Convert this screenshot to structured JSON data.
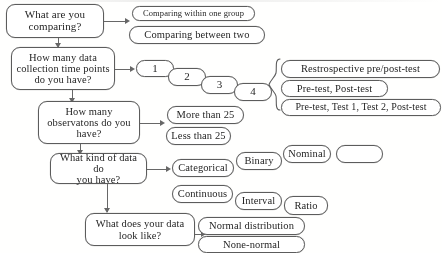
{
  "diagram": {
    "type": "flowchart",
    "ink_color": "#5d5d5d",
    "background_color": "#fdfdfc"
  },
  "questions": [
    {
      "id": "q1",
      "line1": "What are you",
      "line2": "comparing?"
    },
    {
      "id": "q2",
      "line1": "How many data",
      "line2": "collection time points",
      "line3": "do you have?"
    },
    {
      "id": "q3",
      "line1": "How many",
      "line2": "observatons do you",
      "line3": "have?"
    },
    {
      "id": "q4",
      "line1": "What kind of data do",
      "line2": "you have?"
    },
    {
      "id": "q5",
      "line1": "What does your data",
      "line2": "look like?"
    }
  ],
  "comparing_options": [
    {
      "label": "Comparing within one group"
    },
    {
      "label": "Comparing between two"
    }
  ],
  "timepoint_options": [
    {
      "label": "1"
    },
    {
      "label": "2"
    },
    {
      "label": "3"
    },
    {
      "label": "4"
    }
  ],
  "design_options": [
    {
      "label": "Restrospective pre/post-test"
    },
    {
      "label": "Pre-test, Post-test"
    },
    {
      "label": "Pre-test, Test 1, Test 2, Post-test"
    }
  ],
  "observation_options": [
    {
      "label": "More than 25"
    },
    {
      "label": "Less than 25"
    }
  ],
  "data_type_options": [
    {
      "label": "Categorical"
    },
    {
      "label": "Binary"
    },
    {
      "label": "Nominal"
    },
    {
      "label": ""
    },
    {
      "label": "Continuous"
    },
    {
      "label": "Interval"
    },
    {
      "label": "Ratio"
    }
  ],
  "distribution_options": [
    {
      "label": "Normal distribution"
    },
    {
      "label": "None-normal"
    }
  ]
}
